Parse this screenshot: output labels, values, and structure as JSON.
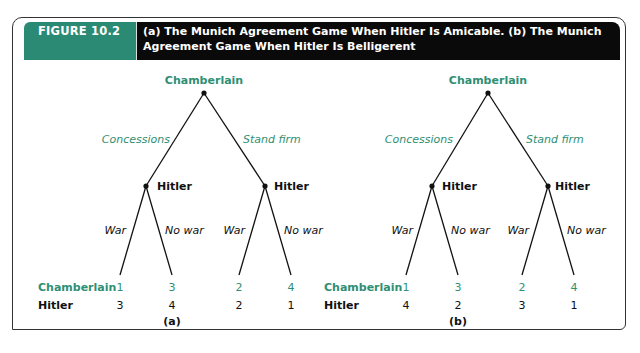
{
  "figure": {
    "label": "FIGURE 10.2",
    "title": "(a) The Munich Agreement Game When Hitler Is Amicable. (b) The Munich Agreement Game When Hitler Is Belligerent",
    "accent_color": "#2a8a73"
  },
  "trees": [
    {
      "caption": "(a)",
      "root_player": "Chamberlain",
      "root_actions": [
        "Concessions",
        "Stand firm"
      ],
      "second_player": "Hitler",
      "second_actions": [
        "War",
        "No war"
      ],
      "row_labels": [
        "Chamberlain",
        "Hitler"
      ],
      "payoffs": {
        "chamberlain": [
          "1",
          "3",
          "2",
          "4"
        ],
        "hitler": [
          "3",
          "4",
          "2",
          "1"
        ]
      }
    },
    {
      "caption": "(b)",
      "root_player": "Chamberlain",
      "root_actions": [
        "Concessions",
        "Stand firm"
      ],
      "second_player": "Hitler",
      "second_actions": [
        "War",
        "No war"
      ],
      "row_labels": [
        "Chamberlain",
        "Hitler"
      ],
      "payoffs": {
        "chamberlain": [
          "1",
          "3",
          "2",
          "4"
        ],
        "hitler": [
          "4",
          "2",
          "3",
          "1"
        ]
      }
    }
  ]
}
